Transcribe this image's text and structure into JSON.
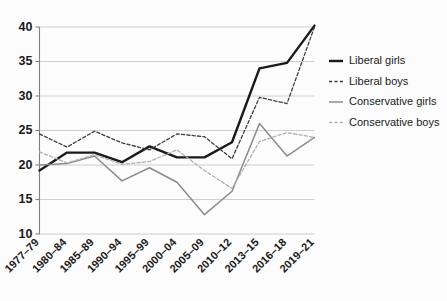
{
  "chart_data": {
    "type": "line",
    "title": "",
    "subtitle": "",
    "xlabel": "",
    "ylabel": "",
    "ylim": [
      10,
      40
    ],
    "yticks": [
      10,
      15,
      20,
      25,
      30,
      35,
      40
    ],
    "ytick_labels": [
      "10",
      "15",
      "20",
      "25",
      "30",
      "35",
      "40"
    ],
    "grid": true,
    "legend_position": "right",
    "categories": [
      "1977–79",
      "1980–84",
      "1985–89",
      "1990–94",
      "1995–99",
      "2000–04",
      "2005–09",
      "2010–12",
      "2013–15",
      "2016–18",
      "2019–21"
    ],
    "series": [
      {
        "name": "Liberal girls",
        "color": "#1a1a1a",
        "style": "solid",
        "width": 2.4,
        "values": [
          19.2,
          21.8,
          21.8,
          20.4,
          22.7,
          21.1,
          21.1,
          23.3,
          34.0,
          34.8,
          40.2
        ]
      },
      {
        "name": "Liberal boys",
        "color": "#3d3d3d",
        "style": "dashed",
        "width": 1.3,
        "values": [
          24.5,
          22.6,
          24.9,
          23.2,
          22.2,
          24.5,
          24.1,
          20.9,
          29.8,
          28.9,
          40.0
        ]
      },
      {
        "name": "Conservative girls",
        "color": "#8c8c8c",
        "style": "solid",
        "width": 1.5,
        "values": [
          20.0,
          20.2,
          21.3,
          17.7,
          19.6,
          17.5,
          12.8,
          16.2,
          26.0,
          21.3,
          24.0
        ]
      },
      {
        "name": "Conservative boys",
        "color": "#b0b0b0",
        "style": "dashed",
        "width": 1.3,
        "values": [
          21.9,
          20.3,
          21.5,
          20.1,
          20.5,
          22.2,
          19.2,
          16.6,
          23.4,
          24.7,
          24.0
        ]
      }
    ]
  },
  "legend": {
    "items": [
      {
        "label": "Liberal girls"
      },
      {
        "label": "Liberal boys"
      },
      {
        "label": "Conservative girls"
      },
      {
        "label": "Conservative boys"
      }
    ]
  }
}
